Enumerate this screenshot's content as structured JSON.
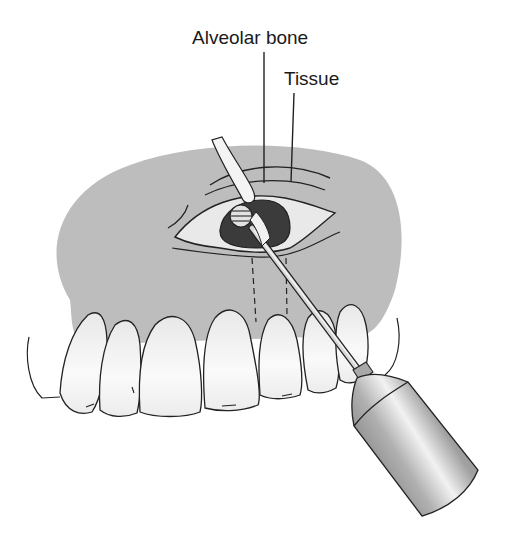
{
  "figure": {
    "labels": {
      "alveolar_bone": "Alveolar bone",
      "tissue": "Tissue"
    },
    "colors": {
      "gum_fill": "#b9b9b9",
      "tooth_fill": "#f4f4f4",
      "outline": "#222222",
      "bone_window": "#3a3a3a",
      "instrument_light": "#e6e6e6",
      "instrument_dark": "#8a8a8a"
    }
  }
}
